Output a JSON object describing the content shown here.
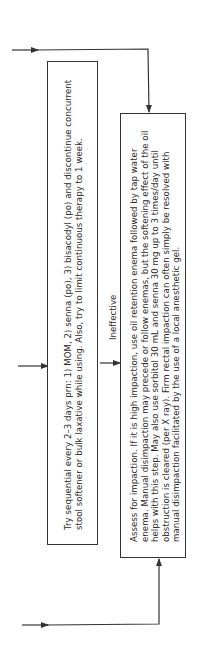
{
  "diagram": {
    "orientation": "rotated-90-ccw",
    "colors": {
      "line": "#333333",
      "text": "#2a2a2a",
      "background": "#ffffff"
    },
    "box_sequential_laxatives": {
      "text": "Try sequential every 2–3 days prn: 1) MOM, 2) senna (po), 3) bisacodyl (po) and discontinue concurrent stool softener or bulk laxative while using. Also, try to limit continuous therapy to 1 week."
    },
    "edge_label": {
      "text": "Ineffective"
    },
    "box_assess_impaction": {
      "text": "Assess for impaction. If it is high impaction, use oil retention enema followed by tap water enema. Manual disimpaction may precede or follow enemas, but the softening effect of the oil helps with this step. May also use sorbitol 30 mL and senna 30 mg up to 3 times/day until obstruction is cleared (per X ray). Firm rectal impaction can often simply be resolved with manual disimpaction facilitated by the use of a local anesthetic gel."
    },
    "arrows": [
      {
        "name": "top-incoming-arrow",
        "target": "box_assess_impaction"
      },
      {
        "name": "middle-incoming-arrow",
        "target": "box_sequential_laxatives"
      },
      {
        "name": "ineffective-arrow",
        "from": "box_sequential_laxatives",
        "target": "box_assess_impaction"
      },
      {
        "name": "bottom-incoming-arrow",
        "target": "box_assess_impaction"
      }
    ]
  }
}
